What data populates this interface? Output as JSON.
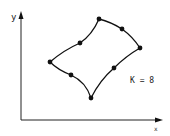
{
  "diagram": {
    "axes": {
      "x_label": "x",
      "y_label": "y"
    },
    "annotation": "K = 8",
    "points": [
      {
        "x": 99,
        "y": 19
      },
      {
        "x": 122,
        "y": 29
      },
      {
        "x": 140,
        "y": 48
      },
      {
        "x": 114,
        "y": 68
      },
      {
        "x": 91,
        "y": 98
      },
      {
        "x": 71,
        "y": 75
      },
      {
        "x": 50,
        "y": 62
      },
      {
        "x": 80,
        "y": 43
      }
    ],
    "colors": {
      "stroke": "#111111",
      "background": "#ffffff"
    }
  }
}
